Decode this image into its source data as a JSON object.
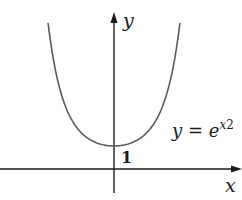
{
  "figure": {
    "type": "function-graph",
    "function": "y = e^{x^2}",
    "axes": {
      "x_label": "x",
      "y_label": "y"
    },
    "annotations": {
      "y_intercept_label": "1",
      "equation": {
        "lhs": "y",
        "equals": "=",
        "base": "e",
        "exponent_var": "x",
        "exponent_power": "2"
      }
    },
    "colors": {
      "axis": "#1a1a1a",
      "curve": "#5a5a5a",
      "text": "#1a1a1a",
      "background": "#ffffff"
    },
    "mapping": {
      "origin_px": [
        114,
        169
      ],
      "x_scale_px": 48.5,
      "y_scale_px": 23,
      "x_range": [
        -1.36,
        1.36
      ]
    }
  }
}
